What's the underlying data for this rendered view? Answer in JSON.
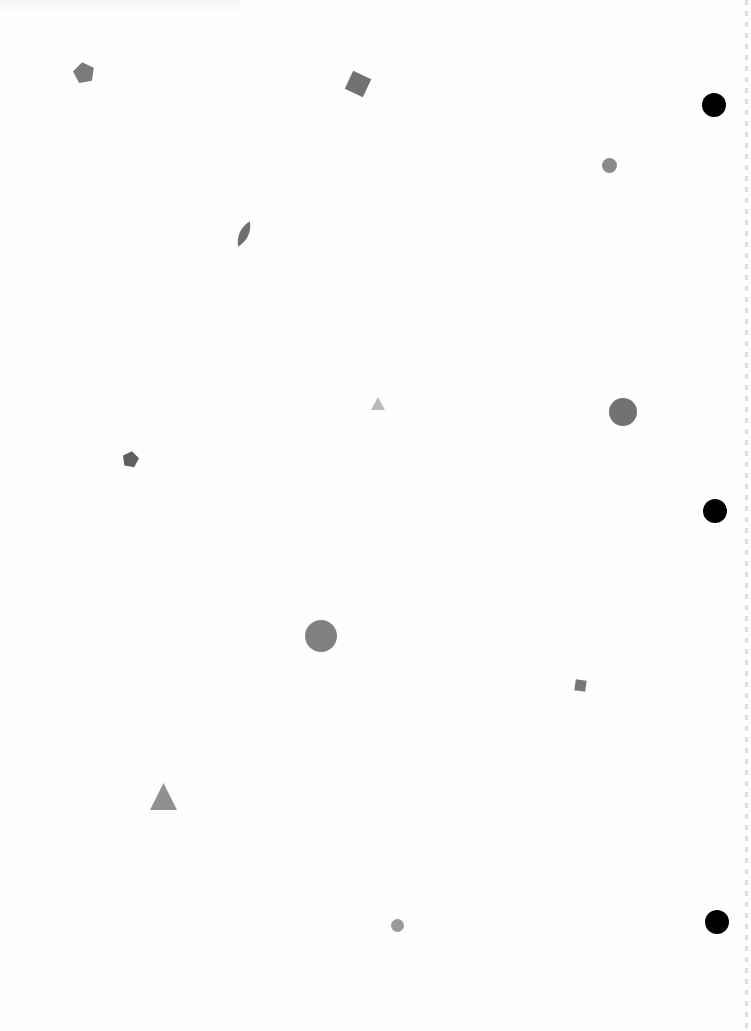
{
  "page": {
    "background": "#fefefe"
  },
  "punch_holes": [
    {
      "name": "punch-hole-top",
      "cx": 714,
      "cy": 105,
      "r": 12,
      "color": "#000000"
    },
    {
      "name": "punch-hole-middle",
      "cx": 715,
      "cy": 511,
      "r": 12,
      "color": "#000000"
    },
    {
      "name": "punch-hole-bottom",
      "cx": 717,
      "cy": 922,
      "r": 12,
      "color": "#000000"
    }
  ],
  "shapes": [
    {
      "name": "pentagon-top-left",
      "type": "pentagon",
      "x": 73,
      "y": 62,
      "w": 22,
      "h": 22,
      "rotate": -10,
      "color": "#7b7b7b"
    },
    {
      "name": "square-top-center",
      "type": "square",
      "x": 348,
      "y": 74,
      "w": 20,
      "h": 20,
      "rotate": 25,
      "color": "#727272"
    },
    {
      "name": "circle-small-top-right",
      "type": "circle",
      "x": 602,
      "y": 158,
      "w": 15,
      "h": 15,
      "rotate": 0,
      "color": "#8a8a8a"
    },
    {
      "name": "leaf-left",
      "type": "leaf",
      "x": 235,
      "y": 220,
      "w": 18,
      "h": 28,
      "rotate": 25,
      "color": "#6f6f6f"
    },
    {
      "name": "triangle-small-center",
      "type": "triangle",
      "x": 371,
      "y": 397,
      "w": 14,
      "h": 13,
      "rotate": 0,
      "color": "#b9b9b9"
    },
    {
      "name": "circle-right",
      "type": "circle",
      "x": 609,
      "y": 398,
      "w": 28,
      "h": 28,
      "rotate": 0,
      "color": "#727272"
    },
    {
      "name": "pentagon-left",
      "type": "pentagon",
      "x": 122,
      "y": 451,
      "w": 17,
      "h": 17,
      "rotate": 10,
      "color": "#5f5f5f"
    },
    {
      "name": "circle-textured-center",
      "type": "circle",
      "x": 305,
      "y": 620,
      "w": 32,
      "h": 32,
      "rotate": 0,
      "color": "#808080"
    },
    {
      "name": "square-small-right",
      "type": "square",
      "x": 575,
      "y": 680,
      "w": 11,
      "h": 11,
      "rotate": 8,
      "color": "#787878"
    },
    {
      "name": "triangle-bottom-left",
      "type": "triangle",
      "x": 150,
      "y": 783,
      "w": 27,
      "h": 27,
      "rotate": 0,
      "color": "#909090"
    },
    {
      "name": "circle-small-bottom",
      "type": "circle",
      "x": 391,
      "y": 919,
      "w": 13,
      "h": 13,
      "rotate": 0,
      "color": "#9a9a9a"
    }
  ]
}
